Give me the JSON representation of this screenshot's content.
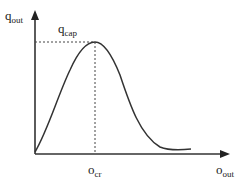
{
  "diagram": {
    "type": "bell-curve",
    "y_axis": {
      "label_main": "q",
      "label_sub": "out"
    },
    "x_axis": {
      "label_main": "o",
      "label_sub": "out"
    },
    "peak": {
      "y_label_main": "q",
      "y_label_sub": "cap",
      "x_label_main": "o",
      "x_label_sub": "cr"
    },
    "colors": {
      "line": "#333333",
      "background": "#ffffff"
    }
  }
}
